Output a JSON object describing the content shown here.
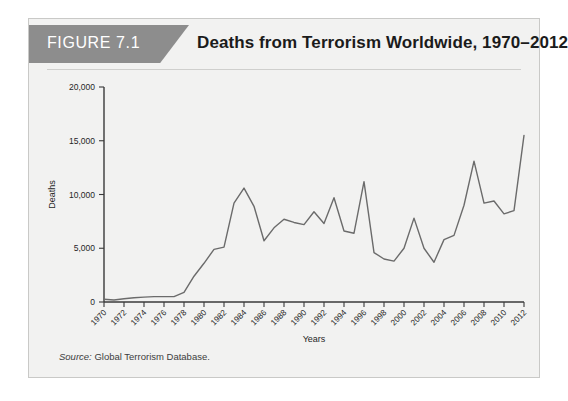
{
  "figure": {
    "badge_label": "FIGURE 7.1",
    "title": "Deaths from Terrorism Worldwide, 1970–2012",
    "source_prefix": "Source:",
    "source_text": " Global Terrorism Database."
  },
  "colors": {
    "badge_bg": "#8d8d8d",
    "card_bg": "#f2f2f1",
    "card_border": "#c9c9c7",
    "line": "#6b6b6b",
    "axis": "#3a3a3a",
    "title_text": "#1b1b1b",
    "badge_text": "#ffffff"
  },
  "chart_data": {
    "type": "line",
    "title": "Deaths from Terrorism Worldwide, 1970–2012",
    "xlabel": "Years",
    "ylabel": "Deaths",
    "xlim": [
      1970,
      2012
    ],
    "ylim": [
      0,
      20000
    ],
    "grid": false,
    "legend": null,
    "ytick_labels": [
      "0",
      "5,000",
      "10,000",
      "15,000",
      "20,000"
    ],
    "ytick_values": [
      0,
      5000,
      10000,
      15000,
      20000
    ],
    "xtick_labels": [
      "1970",
      "1972",
      "1974",
      "1976",
      "1978",
      "1980",
      "1982",
      "1984",
      "1986",
      "1988",
      "1990",
      "1992",
      "1994",
      "1996",
      "1998",
      "2000",
      "2002",
      "2004",
      "2006",
      "2008",
      "2010",
      "2012"
    ],
    "xtick_values": [
      1970,
      1972,
      1974,
      1976,
      1978,
      1980,
      1982,
      1984,
      1986,
      1988,
      1990,
      1992,
      1994,
      1996,
      1998,
      2000,
      2002,
      2004,
      2006,
      2008,
      2010,
      2012
    ],
    "x": [
      1970,
      1971,
      1972,
      1973,
      1974,
      1975,
      1976,
      1977,
      1978,
      1979,
      1980,
      1981,
      1982,
      1983,
      1984,
      1985,
      1986,
      1987,
      1988,
      1989,
      1990,
      1991,
      1992,
      1993,
      1994,
      1995,
      1996,
      1997,
      1998,
      1999,
      2000,
      2001,
      2002,
      2003,
      2004,
      2005,
      2006,
      2007,
      2008,
      2009,
      2010,
      2011,
      2012
    ],
    "values": [
      250,
      180,
      300,
      400,
      450,
      500,
      500,
      500,
      900,
      2400,
      3600,
      4900,
      5100,
      9200,
      10600,
      8900,
      5700,
      6900,
      7700,
      7400,
      7200,
      8400,
      7300,
      9700,
      6600,
      6400,
      11200,
      4600,
      4000,
      3800,
      5000,
      7800,
      5000,
      3700,
      5800,
      6200,
      9000,
      13100,
      9200,
      9400,
      8200,
      8500,
      15500
    ],
    "series_name": "Deaths from terrorism"
  }
}
